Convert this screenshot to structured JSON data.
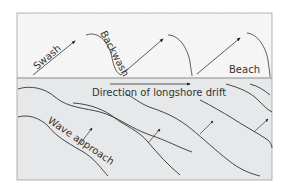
{
  "diagram": {
    "title": "Longshore drift",
    "zones": {
      "beach": {
        "label": "Beach",
        "fill": "#f7f7f7"
      },
      "sea": {
        "fill": "#e6e8ea"
      }
    },
    "labels": {
      "swash": "Swash",
      "backwash": "Backwash",
      "beach": "Beach",
      "longshore_drift": "Direction of longshore drift",
      "wave_approach": "Wave approach"
    },
    "colors": {
      "line": "#333333",
      "frame": "#9a9a9a",
      "boundary": "#8a8a8a"
    }
  }
}
